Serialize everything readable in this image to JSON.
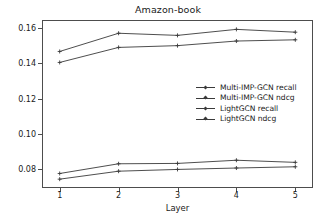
{
  "chart_data": {
    "type": "line",
    "title": "Amazon-book",
    "xlabel": "Layer",
    "ylabel": "",
    "x": [
      1,
      2,
      3,
      4,
      5
    ],
    "xticklabels": [
      "1",
      "2",
      "3",
      "4",
      "5"
    ],
    "yticklabels": [
      "0.08",
      "0.10",
      "0.12",
      "0.14",
      "0.16"
    ],
    "ytickvalues": [
      0.08,
      0.1,
      0.12,
      0.14,
      0.16
    ],
    "xlim": [
      0.7,
      5.3
    ],
    "ylim": [
      0.0695,
      0.1645
    ],
    "grid": false,
    "legend_position": "center-right",
    "marker": "+",
    "line_color": "#3a3a3a",
    "series": [
      {
        "name": "Multi-IMP-GCN recall",
        "values": [
          0.1467,
          0.157,
          0.1558,
          0.1592,
          0.1576
        ]
      },
      {
        "name": "Multi-IMP-GCN ndcg",
        "values": [
          0.0777,
          0.0832,
          0.0834,
          0.0852,
          0.084
        ]
      },
      {
        "name": "LightGCN recall",
        "values": [
          0.1405,
          0.149,
          0.15,
          0.1526,
          0.1533
        ]
      },
      {
        "name": "LightGCN ndcg",
        "values": [
          0.0745,
          0.079,
          0.08,
          0.0808,
          0.0815
        ]
      }
    ]
  },
  "legend": {
    "items": [
      {
        "label": "Multi-IMP-GCN recall"
      },
      {
        "label": "Multi-IMP-GCN ndcg"
      },
      {
        "label": "LightGCN recall"
      },
      {
        "label": "LightGCN ndcg"
      }
    ]
  }
}
